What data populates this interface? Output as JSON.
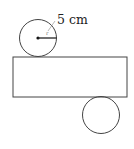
{
  "diagram": {
    "type": "cylinder-net",
    "radius_label": "5 cm",
    "radius_tick": "r",
    "colors": {
      "stroke": "#444444",
      "text": "#222222",
      "background": "#ffffff"
    },
    "top_circle": {
      "cx": 38,
      "cy": 38,
      "r": 18
    },
    "rectangle": {
      "x": 13,
      "y": 57,
      "width": 114,
      "height": 40
    },
    "bottom_circle": {
      "cx": 101,
      "cy": 115,
      "r": 18
    }
  }
}
